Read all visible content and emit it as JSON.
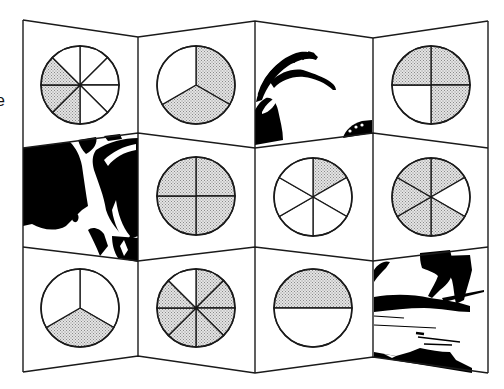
{
  "figure": {
    "stray_glyph": "e",
    "colors": {
      "line": "#1a1a1a",
      "shade": "#cfcfcf",
      "ink": "#000000",
      "paper": "#ffffff"
    },
    "columns_x": [
      23,
      138,
      255,
      373,
      488
    ],
    "edges_y": [
      [
        20,
        37,
        21,
        38,
        21
      ],
      [
        148,
        133,
        148,
        133,
        148
      ],
      [
        247,
        261,
        247,
        261,
        247
      ],
      [
        372,
        356,
        373,
        357,
        373
      ]
    ],
    "panels": [
      {
        "row": 0,
        "col": 0,
        "type": "pie",
        "name": "pie-eighths-3-shaded",
        "sectors": 8,
        "shaded": [
          4,
          5,
          6
        ],
        "cx": 80,
        "cy": 85,
        "r": 39
      },
      {
        "row": 0,
        "col": 1,
        "type": "pie",
        "name": "pie-thirds-2-shaded",
        "sectors": 3,
        "shaded": [
          0,
          1
        ],
        "cx": 196,
        "cy": 85,
        "r": 39
      },
      {
        "row": 0,
        "col": 2,
        "type": "image",
        "name": "ibex-horns-illustration"
      },
      {
        "row": 0,
        "col": 3,
        "type": "pie",
        "name": "pie-quarters-3-shaded",
        "sectors": 4,
        "shaded": [
          0,
          1,
          3
        ],
        "cx": 431,
        "cy": 85,
        "r": 39
      },
      {
        "row": 1,
        "col": 0,
        "type": "image",
        "name": "ibex-body-illustration"
      },
      {
        "row": 1,
        "col": 1,
        "type": "pie",
        "name": "pie-quarters-4-shaded",
        "sectors": 4,
        "shaded": [
          0,
          1,
          2,
          3
        ],
        "cx": 196,
        "cy": 196,
        "r": 39
      },
      {
        "row": 1,
        "col": 2,
        "type": "pie",
        "name": "pie-sixths-1-shaded",
        "sectors": 6,
        "shaded": [
          0
        ],
        "cx": 313,
        "cy": 197,
        "r": 39
      },
      {
        "row": 1,
        "col": 3,
        "type": "pie",
        "name": "pie-sixths-5-shaded",
        "sectors": 6,
        "shaded": [
          0,
          2,
          3,
          4,
          5
        ],
        "cx": 431,
        "cy": 197,
        "r": 39
      },
      {
        "row": 2,
        "col": 0,
        "type": "pie",
        "name": "pie-thirds-1-shaded",
        "sectors": 3,
        "shaded": [
          1
        ],
        "cx": 80,
        "cy": 308,
        "r": 39
      },
      {
        "row": 2,
        "col": 1,
        "type": "pie",
        "name": "pie-eighths-7-shaded",
        "sectors": 8,
        "shaded": [
          0,
          1,
          2,
          3,
          4,
          5,
          6
        ],
        "cx": 196,
        "cy": 308,
        "r": 39
      },
      {
        "row": 2,
        "col": 2,
        "type": "pie",
        "name": "pie-halves-1-shaded",
        "sectors": 2,
        "shaded": [
          0
        ],
        "cx": 313,
        "cy": 308,
        "r": 39
      },
      {
        "row": 2,
        "col": 3,
        "type": "image",
        "name": "ibex-legs-illustration"
      }
    ]
  }
}
